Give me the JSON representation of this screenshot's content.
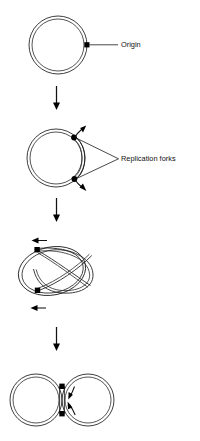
{
  "figure": {
    "background_color": "#ffffff",
    "line_color": "#1b1b1b",
    "marker_color": "#000000",
    "width": 200,
    "height": 441
  },
  "labels": {
    "origin": "Origin",
    "replication_forks": "Replication forks"
  },
  "stages": [
    {
      "id": "stage-1",
      "name": "unreplicated-circular-chromosome",
      "description": "Closed double-stranded circular chromosome with a single origin marked",
      "markers": 1
    },
    {
      "id": "stage-2",
      "name": "initiation-replication-bubble",
      "description": "Small replication bubble opened at the origin with two replication forks moving in opposite directions",
      "markers": 2
    },
    {
      "id": "stage-3",
      "name": "theta-intermediate",
      "description": "Theta-shaped intermediate; the two forks have travelled far apart around the circle",
      "markers": 2
    },
    {
      "id": "stage-4",
      "name": "nearly-completed-daughter-circles",
      "description": "Replication almost complete; two interlocked daughter circles joined at a narrow neck",
      "markers": 2
    }
  ],
  "transition_arrows": [
    {
      "id": "arrow-1-2",
      "direction": "down"
    },
    {
      "id": "arrow-2-3",
      "direction": "down"
    },
    {
      "id": "arrow-3-4",
      "direction": "down"
    }
  ],
  "fork_direction_arrows": [
    {
      "id": "stage2-fork-top",
      "direction": "clockwise-outward"
    },
    {
      "id": "stage2-fork-bottom",
      "direction": "counterclockwise-outward"
    },
    {
      "id": "stage3-fork-top",
      "direction": "left"
    },
    {
      "id": "stage3-fork-bottom",
      "direction": "left"
    },
    {
      "id": "stage4-fork-top",
      "direction": "down"
    },
    {
      "id": "stage4-fork-bottom",
      "direction": "up"
    }
  ]
}
